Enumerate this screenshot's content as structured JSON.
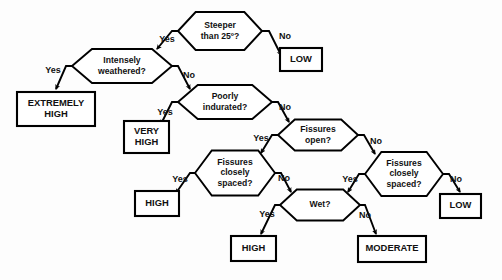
{
  "diagram": {
    "type": "flowchart",
    "colors": {
      "background": "#fdfdfd",
      "node_fill": "#ffffff",
      "stroke": "#000000",
      "text": "#111111"
    },
    "decisions": [
      {
        "id": "steeper",
        "label_lines": [
          "Steeper",
          "than 25º?"
        ],
        "cx": 220,
        "cy": 31,
        "w": 84,
        "h": 38
      },
      {
        "id": "weathered",
        "label_lines": [
          "Intensely",
          "weathered?"
        ],
        "cx": 122,
        "cy": 66,
        "w": 100,
        "h": 34
      },
      {
        "id": "indurated",
        "label_lines": [
          "Poorly",
          "indurated?"
        ],
        "cx": 225,
        "cy": 102,
        "w": 94,
        "h": 34
      },
      {
        "id": "fissures-open",
        "label_lines": [
          "Fissures",
          "open?"
        ],
        "cx": 318,
        "cy": 135,
        "w": 80,
        "h": 31
      },
      {
        "id": "fissures-closely-left",
        "label_lines": [
          "Fissures",
          "closely",
          "spaced?"
        ],
        "cx": 235,
        "cy": 173,
        "w": 80,
        "h": 45
      },
      {
        "id": "fissures-closely-right",
        "label_lines": [
          "Fissures",
          "closely",
          "spaced?"
        ],
        "cx": 404,
        "cy": 174,
        "w": 78,
        "h": 44
      },
      {
        "id": "wet",
        "label_lines": [
          "Wet?"
        ],
        "cx": 320,
        "cy": 205,
        "w": 80,
        "h": 31
      }
    ],
    "terminals": [
      {
        "id": "low-top",
        "label_lines": [
          "LOW"
        ],
        "x": 280,
        "y": 48,
        "w": 42,
        "h": 23
      },
      {
        "id": "extremely-high",
        "label_lines": [
          "EXTREMELY",
          "HIGH"
        ],
        "x": 17,
        "y": 92,
        "w": 78,
        "h": 34
      },
      {
        "id": "very-high",
        "label_lines": [
          "VERY",
          "HIGH"
        ],
        "x": 124,
        "y": 121,
        "w": 45,
        "h": 32
      },
      {
        "id": "high-left",
        "label_lines": [
          "HIGH"
        ],
        "x": 135,
        "y": 191,
        "w": 44,
        "h": 25
      },
      {
        "id": "low-bottom",
        "label_lines": [
          "LOW"
        ],
        "x": 440,
        "y": 194,
        "w": 41,
        "h": 24
      },
      {
        "id": "high-bottom",
        "label_lines": [
          "HIGH"
        ],
        "x": 231,
        "y": 236,
        "w": 45,
        "h": 25
      },
      {
        "id": "moderate",
        "label_lines": [
          "MODERATE"
        ],
        "x": 358,
        "y": 236,
        "w": 68,
        "h": 26
      }
    ],
    "edges": [
      {
        "id": "steeper-yes",
        "from": "steeper",
        "to": "weathered",
        "label": "Yes",
        "label_x": 167,
        "label_y": 40,
        "points": "178,31 172,31 157,49"
      },
      {
        "id": "steeper-no",
        "from": "steeper",
        "to": "low-top",
        "label": "No",
        "label_x": 285,
        "label_y": 37,
        "points": "262,31 269,31 281,55"
      },
      {
        "id": "weathered-yes",
        "from": "weathered",
        "to": "extremely-high",
        "label": "Yes",
        "label_x": 53,
        "label_y": 71,
        "points": "72,66 66,66 56,89"
      },
      {
        "id": "weathered-no",
        "from": "weathered",
        "to": "indurated",
        "label": "No",
        "label_x": 189,
        "label_y": 76,
        "points": "172,66 178,66 190,89"
      },
      {
        "id": "indurated-yes",
        "from": "indurated",
        "to": "very-high",
        "label": "Yes",
        "label_x": 165,
        "label_y": 113,
        "points": "178,102 172,102 161,124"
      },
      {
        "id": "indurated-no",
        "from": "indurated",
        "to": "fissures-open",
        "label": "No",
        "label_x": 285,
        "label_y": 108,
        "points": "272,102 278,102 289,122"
      },
      {
        "id": "fissures-open-yes",
        "from": "fissures-open",
        "to": "fissures-closely-left",
        "label": "Yes",
        "label_x": 261,
        "label_y": 139,
        "points": "278,135 272,135 261,153"
      },
      {
        "id": "fissures-open-no",
        "from": "fissures-open",
        "to": "fissures-closely-right",
        "label": "No",
        "label_x": 376,
        "label_y": 142,
        "points": "358,135 364,135 375,154"
      },
      {
        "id": "fissures-left-yes",
        "from": "fissures-closely-left",
        "to": "high-left",
        "label": "Yes",
        "label_x": 180,
        "label_y": 180,
        "points": "195,173 190,173 176,193"
      },
      {
        "id": "fissures-left-no",
        "from": "fissures-closely-left",
        "to": "wet",
        "label": "No",
        "label_x": 284,
        "label_y": 179,
        "points": "275,173 281,173 291,192"
      },
      {
        "id": "fissures-right-yes",
        "from": "fissures-closely-right",
        "to": "wet",
        "label": "Yes",
        "label_x": 350,
        "label_y": 180,
        "points": "365,174 359,174 348,192"
      },
      {
        "id": "fissures-right-no",
        "from": "fissures-closely-right",
        "to": "low-bottom",
        "label": "No",
        "label_x": 456,
        "label_y": 180,
        "points": "443,174 449,174 460,192"
      },
      {
        "id": "wet-yes",
        "from": "wet",
        "to": "high-bottom",
        "label": "Yes",
        "label_x": 267,
        "label_y": 215,
        "points": "280,205 275,205 261,234"
      },
      {
        "id": "wet-no",
        "from": "wet",
        "to": "moderate",
        "label": "No",
        "label_x": 365,
        "label_y": 216,
        "points": "360,205 365,205 376,234"
      }
    ]
  }
}
